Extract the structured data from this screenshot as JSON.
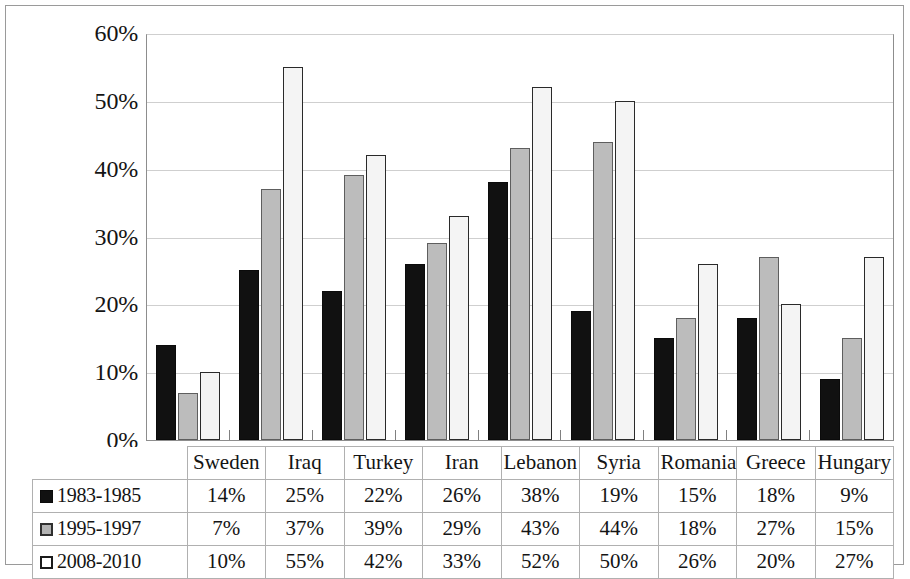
{
  "chart_data": {
    "type": "bar",
    "title": "",
    "subtitle": "",
    "xlabel": "",
    "ylabel": "",
    "ylim": [
      0,
      60
    ],
    "y_tick_labels": [
      "60%",
      "50%",
      "40%",
      "30%",
      "20%",
      "10%",
      "0%"
    ],
    "y_tick_values": [
      60,
      50,
      40,
      30,
      20,
      10,
      0
    ],
    "grid": true,
    "legend_position": "table-left",
    "categories": [
      "Sweden",
      "Iraq",
      "Turkey",
      "Iran",
      "Lebanon",
      "Syria",
      "Romania",
      "Greece",
      "Hungary"
    ],
    "series": [
      {
        "name": "1983-1985",
        "marker": "black-square",
        "color": "#111111",
        "values": [
          14,
          25,
          22,
          26,
          38,
          19,
          15,
          18,
          9
        ],
        "labels": [
          "14%",
          "25%",
          "22%",
          "26%",
          "38%",
          "19%",
          "15%",
          "18%",
          "9%"
        ]
      },
      {
        "name": "1995-1997",
        "marker": "gray-square",
        "color": "#bcbcbc",
        "values": [
          7,
          37,
          39,
          29,
          43,
          44,
          18,
          27,
          15
        ],
        "labels": [
          "7%",
          "37%",
          "39%",
          "29%",
          "43%",
          "44%",
          "18%",
          "27%",
          "15%"
        ]
      },
      {
        "name": "2008-2010",
        "marker": "white-square",
        "color": "#f4f4f4",
        "values": [
          10,
          55,
          42,
          33,
          52,
          50,
          26,
          20,
          27
        ],
        "labels": [
          "10%",
          "55%",
          "42%",
          "33%",
          "52%",
          "50%",
          "26%",
          "20%",
          "27%"
        ]
      }
    ]
  },
  "table": {
    "corner_label": "",
    "column_headers": [
      "Sweden",
      "Iraq",
      "Turkey",
      "Iran",
      "Lebanon",
      "Syria",
      "Romania",
      "Greece",
      "Hungary"
    ],
    "rows": [
      {
        "label": "1983-1985",
        "cells": [
          "14%",
          "25%",
          "22%",
          "26%",
          "38%",
          "19%",
          "15%",
          "18%",
          "9%"
        ]
      },
      {
        "label": "1995-1997",
        "cells": [
          "7%",
          "37%",
          "39%",
          "29%",
          "43%",
          "44%",
          "18%",
          "27%",
          "15%"
        ]
      },
      {
        "label": "2008-2010",
        "cells": [
          "10%",
          "55%",
          "42%",
          "33%",
          "52%",
          "50%",
          "26%",
          "20%",
          "27%"
        ]
      }
    ]
  }
}
